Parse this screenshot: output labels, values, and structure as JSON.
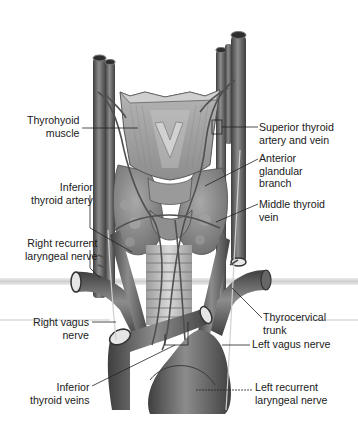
{
  "figure": {
    "colors": {
      "background": "#ffffff",
      "tissue_dark": "#5e5e5e",
      "tissue_mid": "#8a8a8a",
      "tissue_light": "#b9b9b9",
      "label_text": "#1a1a1a",
      "leader_line": "#222222",
      "band": "#d6d6d6"
    }
  },
  "labels": {
    "left": [
      {
        "id": "thyrohyoid-muscle",
        "text": "Thyrohyoid\n   muscle"
      },
      {
        "id": "inferior-thyroid-artery",
        "text": "       Inferior\nthyroid artery"
      },
      {
        "id": "right-recurrent-laryngeal-nerve",
        "text": "Right recurrent\nlaryngeal nerve"
      },
      {
        "id": "right-vagus-nerve",
        "text": "Right vagus\n        nerve"
      },
      {
        "id": "inferior-thyroid-veins",
        "text": "      Inferior\nthyroid veins"
      }
    ],
    "right": [
      {
        "id": "superior-thyroid-artery-and-vein",
        "text": "Superior thyroid\nartery and vein"
      },
      {
        "id": "anterior-glandular-branch",
        "text": "Anterior\nglandular\nbranch"
      },
      {
        "id": "middle-thyroid-vein",
        "text": "Middle thyroid\nvein"
      },
      {
        "id": "thyrocervical-trunk",
        "text": "Thyrocervical\ntrunk"
      },
      {
        "id": "left-vagus-nerve",
        "text": "Left vagus nerve"
      },
      {
        "id": "left-recurrent-laryngeal-nerve",
        "text": "Left recurrent\nlaryngeal nerve"
      }
    ]
  }
}
